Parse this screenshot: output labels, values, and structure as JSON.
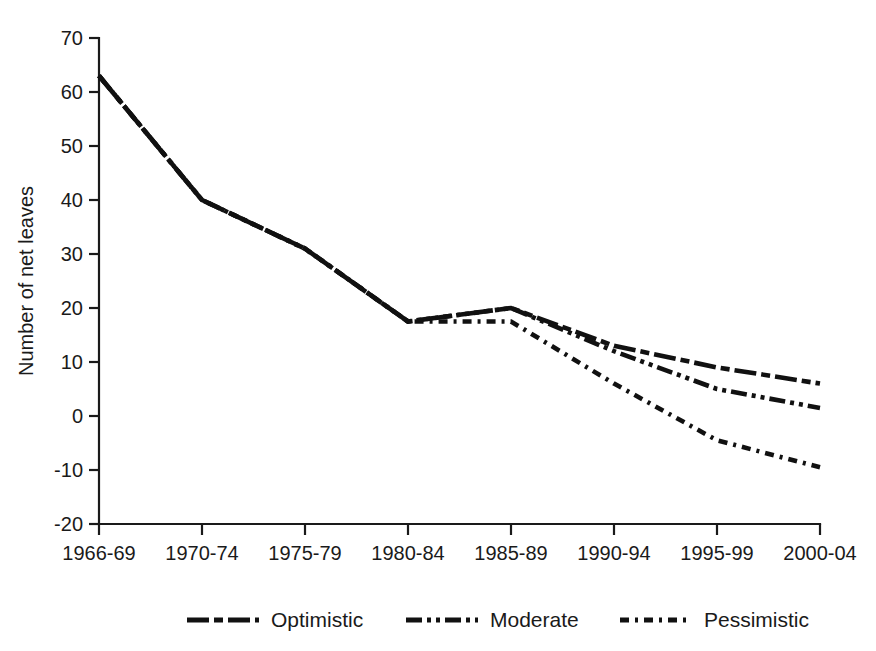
{
  "chart_data": {
    "type": "line",
    "title": "",
    "subtitle": "",
    "xlabel": "",
    "ylabel": "Number of net leaves",
    "categories": [
      "1966-69",
      "1970-74",
      "1975-79",
      "1980-84",
      "1985-89",
      "1990-94",
      "1995-99",
      "2000-04"
    ],
    "ylim": [
      -20,
      70
    ],
    "yticks": [
      -20,
      -10,
      0,
      10,
      20,
      30,
      40,
      50,
      60,
      70
    ],
    "ytick_labels": [
      "-20",
      "-10",
      "0",
      "10",
      "20",
      "30",
      "40",
      "50",
      "60",
      "70"
    ],
    "grid": false,
    "legend_position": "bottom",
    "series": [
      {
        "name": "Optimistic",
        "dash": "long-dash-short-dash",
        "values": [
          63,
          40,
          31,
          17.5,
          20,
          13,
          9,
          6
        ]
      },
      {
        "name": "Moderate",
        "dash": "dash-dot-dot",
        "values": [
          63,
          40,
          31,
          17.5,
          20,
          12,
          5,
          1.5
        ]
      },
      {
        "name": "Pessimistic",
        "dash": "short-dash-dot",
        "values": [
          63,
          40,
          31,
          17.5,
          17.5,
          6,
          -4.5,
          -9.5
        ]
      }
    ]
  },
  "legend": {
    "items": [
      {
        "label": "Optimistic"
      },
      {
        "label": "Moderate"
      },
      {
        "label": "Pessimistic"
      }
    ]
  },
  "axes": {
    "y_title": "Number of net leaves"
  },
  "colors": {
    "line": "#111111",
    "axis": "#1a1a1a",
    "background": "#ffffff"
  }
}
